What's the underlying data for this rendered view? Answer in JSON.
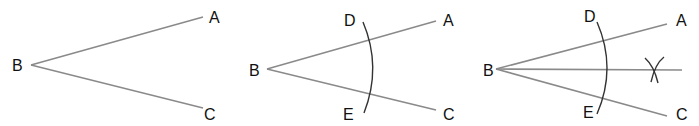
{
  "panels": [
    {
      "step": 1,
      "labels": {
        "vertex": "B",
        "ray1_end": "A",
        "ray2_end": "C"
      }
    },
    {
      "step": 2,
      "labels": {
        "vertex": "B",
        "ray1_end": "A",
        "ray2_end": "C",
        "arc_top": "D",
        "arc_bottom": "E"
      }
    },
    {
      "step": 3,
      "labels": {
        "vertex": "B",
        "ray1_end": "A",
        "ray2_end": "C",
        "arc_top": "D",
        "arc_bottom": "E"
      },
      "bisector_mark": "X"
    }
  ],
  "colors": {
    "rays": "#8a8a8a",
    "arcs": "#333333",
    "text": "#111111",
    "background": "#ffffff"
  }
}
